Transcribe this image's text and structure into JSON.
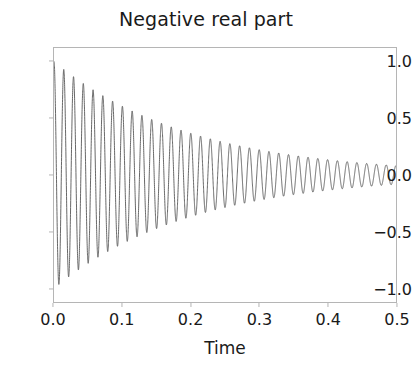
{
  "chart_data": {
    "type": "line",
    "title": "Negative real part",
    "xlabel": "Time",
    "ylabel": "",
    "xlim": [
      0.0,
      0.5
    ],
    "ylim": [
      -1.12,
      1.12
    ],
    "grid": false,
    "legend": null,
    "line_color": "#555555",
    "series": [
      {
        "name": "damped cosine",
        "formula": "exp(-5*t) * cos(2*pi*70*t)",
        "decay_rate": 5.0,
        "frequency_hz": 70,
        "initial_amplitude": 1.0,
        "sample_amplitudes": [
          {
            "t": 0.0,
            "amplitude": 1.0
          },
          {
            "t": 0.125,
            "amplitude": 0.53
          },
          {
            "t": 0.25,
            "amplitude": 0.28
          },
          {
            "t": 0.375,
            "amplitude": 0.15
          },
          {
            "t": 0.5,
            "amplitude": 0.08
          }
        ],
        "x": [
          0.0,
          0.05,
          0.1,
          0.15,
          0.2,
          0.25,
          0.3,
          0.35,
          0.4,
          0.45,
          0.5
        ],
        "y": [
          1.0,
          0.78,
          0.61,
          0.47,
          0.37,
          0.29,
          0.22,
          0.17,
          0.14,
          0.11,
          0.08
        ]
      }
    ],
    "xticks": [
      {
        "value": 0.0,
        "label": "0.0"
      },
      {
        "value": 0.1,
        "label": "0.1"
      },
      {
        "value": 0.2,
        "label": "0.2"
      },
      {
        "value": 0.3,
        "label": "0.3"
      },
      {
        "value": 0.4,
        "label": "0.4"
      },
      {
        "value": 0.5,
        "label": "0.5"
      }
    ],
    "yticks": [
      {
        "value": 1.0,
        "label": "1.0"
      },
      {
        "value": 0.5,
        "label": "0.5"
      },
      {
        "value": 0.0,
        "label": "0.0"
      },
      {
        "value": -0.5,
        "label": "−0.5"
      },
      {
        "value": -1.0,
        "label": "−1.0"
      }
    ]
  }
}
